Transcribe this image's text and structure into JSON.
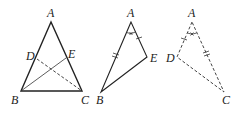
{
  "figure": {
    "type": "geometry",
    "colors": {
      "stroke": "#222222",
      "background": "#ffffff"
    }
  },
  "triangle1": {
    "labels": {
      "A": "A",
      "B": "B",
      "C": "C",
      "D": "D",
      "E": "E"
    },
    "segments": [
      "AB",
      "AC",
      "BC",
      "BE (solid)",
      "CD (dashed)"
    ]
  },
  "triangle2": {
    "labels": {
      "A": "A",
      "B": "B",
      "E": "E"
    },
    "marks": [
      "angle A marked",
      "AB double tick",
      "AE single tick"
    ]
  },
  "triangle3": {
    "labels": {
      "A": "A",
      "C": "C",
      "D": "D"
    },
    "style": "dashed",
    "marks": [
      "angle A marked",
      "AC double tick",
      "AD single tick"
    ]
  }
}
